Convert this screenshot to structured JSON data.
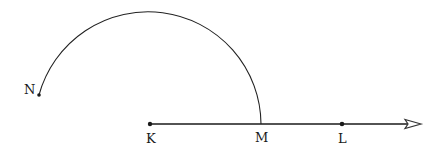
{
  "diagram": {
    "type": "geometry-construction",
    "points": [
      {
        "id": "N",
        "label": "N",
        "x": 39,
        "y": 95,
        "label_x": 24,
        "label_y": 94
      },
      {
        "id": "K",
        "label": "K",
        "x": 150,
        "y": 124,
        "label_x": 146,
        "label_y": 143
      },
      {
        "id": "M",
        "label": "M",
        "x": 261,
        "y": 124,
        "label_x": 255,
        "label_y": 142
      },
      {
        "id": "L",
        "label": "L",
        "x": 342,
        "y": 124,
        "label_x": 338,
        "label_y": 143
      }
    ],
    "ray": {
      "from": "K",
      "through": [
        "M",
        "L"
      ],
      "end_x": 421,
      "y": 124,
      "arrow": true
    },
    "arc": {
      "center": "K",
      "from": "N",
      "to": "M",
      "radius": 113
    },
    "colors": {
      "stroke": "#1a1a1a",
      "background": "#ffffff"
    }
  }
}
